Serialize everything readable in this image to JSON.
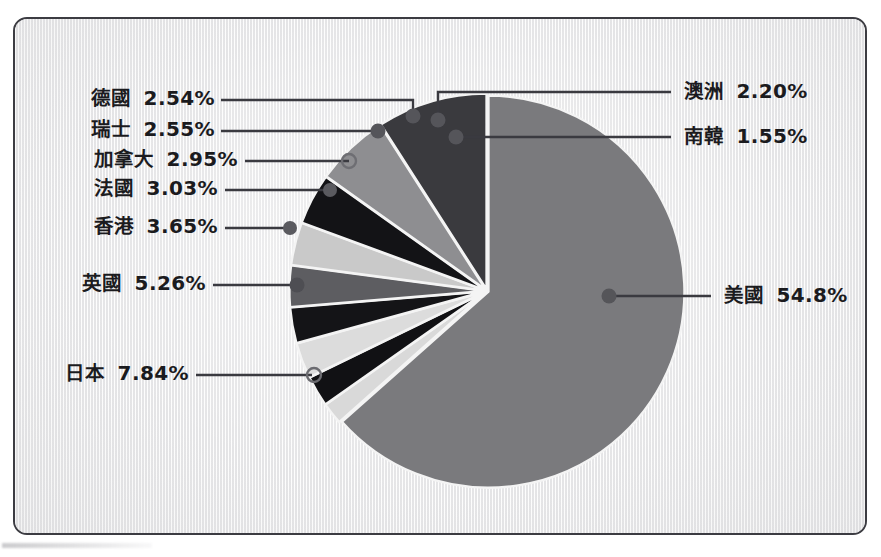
{
  "figure": {
    "background_color": "#f2f2f2",
    "border_color": "#3c3c42"
  },
  "chart_data": {
    "type": "pie",
    "title": "",
    "subtitle": "",
    "xlabel": "",
    "ylabel": "",
    "legend_position": "callout-labels",
    "grid": false,
    "units": "percent",
    "start_angle_deg": 0,
    "direction": "clockwise",
    "categories": [
      "美國",
      "南韓",
      "澳洲",
      "德國",
      "瑞士",
      "加拿大",
      "法國",
      "香港",
      "英國",
      "日本"
    ],
    "values": [
      54.8,
      1.55,
      2.2,
      2.54,
      2.55,
      2.95,
      3.03,
      3.65,
      5.26,
      7.84
    ],
    "value_labels": [
      "54.8%",
      "1.55%",
      "2.20%",
      "2.54%",
      "2.55%",
      "2.95%",
      "3.03%",
      "3.65%",
      "5.26%",
      "7.84%"
    ],
    "slice_colors": [
      "#7a7a7d",
      "#d9d9d9",
      "#111114",
      "#dcdcdc",
      "#141417",
      "#5d5d61",
      "#c9c9c9",
      "#131316",
      "#8e8e91",
      "#3a3a3e"
    ],
    "slices": [
      {
        "label": "美國",
        "value": 54.8,
        "value_label": "54.8%",
        "color": "#7a7a7d",
        "side": "right"
      },
      {
        "label": "南韓",
        "value": 1.55,
        "value_label": "1.55%",
        "color": "#d9d9d9",
        "side": "right"
      },
      {
        "label": "澳洲",
        "value": 2.2,
        "value_label": "2.20%",
        "color": "#111114",
        "side": "right"
      },
      {
        "label": "德國",
        "value": 2.54,
        "value_label": "2.54%",
        "color": "#dcdcdc",
        "side": "left"
      },
      {
        "label": "瑞士",
        "value": 2.55,
        "value_label": "2.55%",
        "color": "#141417",
        "side": "left"
      },
      {
        "label": "加拿大",
        "value": 2.95,
        "value_label": "2.95%",
        "color": "#5d5d61",
        "side": "left"
      },
      {
        "label": "法國",
        "value": 3.03,
        "value_label": "3.03%",
        "color": "#c9c9c9",
        "side": "left"
      },
      {
        "label": "香港",
        "value": 3.65,
        "value_label": "3.65%",
        "color": "#131316",
        "side": "left"
      },
      {
        "label": "英國",
        "value": 5.26,
        "value_label": "5.26%",
        "color": "#8e8e91",
        "side": "left"
      },
      {
        "label": "日本",
        "value": 7.84,
        "value_label": "7.84%",
        "color": "#3a3a3e",
        "side": "left"
      }
    ]
  },
  "labels": {
    "germany": {
      "name": "德國",
      "pct": "2.54%"
    },
    "swiss": {
      "name": "瑞士",
      "pct": "2.55%"
    },
    "canada": {
      "name": "加拿大",
      "pct": "2.95%"
    },
    "france": {
      "name": "法國",
      "pct": "3.03%"
    },
    "hongkong": {
      "name": "香港",
      "pct": "3.65%"
    },
    "uk": {
      "name": "英國",
      "pct": "5.26%"
    },
    "japan": {
      "name": "日本",
      "pct": "7.84%"
    },
    "australia": {
      "name": "澳洲",
      "pct": "2.20%"
    },
    "korea": {
      "name": "南韓",
      "pct": "1.55%"
    },
    "usa": {
      "name": "美國",
      "pct": "54.8%"
    }
  }
}
